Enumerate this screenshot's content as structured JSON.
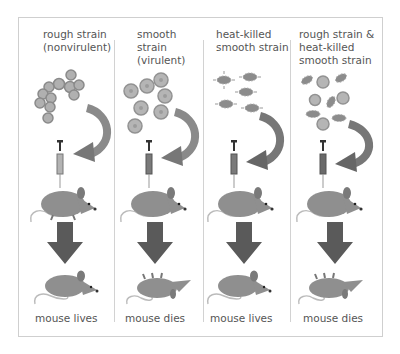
{
  "diagram": {
    "colors": {
      "frame": "#cfcfcf",
      "divider": "#d2d2d2",
      "text": "#555555",
      "cell_fill": "#a8a8a8",
      "cell_ring": "#8e8e8e",
      "arrow": "#5a5a5a",
      "mouse": "#8f8f8f"
    },
    "columns": [
      {
        "id": "rough",
        "title": "rough strain\n(nonvirulent)",
        "bacteria": "rough-cells",
        "injection": "syringe",
        "outcome_label": "mouse lives",
        "outcome": "alive"
      },
      {
        "id": "smooth",
        "title": "smooth strain\n(virulent)",
        "bacteria": "smooth-capsule-cells",
        "injection": "syringe",
        "outcome_label": "mouse dies",
        "outcome": "dead"
      },
      {
        "id": "heat-killed",
        "title": "heat-killed\nsmooth strain",
        "bacteria": "heat-killed-cells",
        "injection": "syringe",
        "outcome_label": "mouse lives",
        "outcome": "alive"
      },
      {
        "id": "mixture",
        "title": "rough strain &\nheat-killed\nsmooth strain",
        "bacteria": "mixed-cells",
        "injection": "syringe",
        "outcome_label": "mouse dies",
        "outcome": "dead"
      }
    ]
  }
}
